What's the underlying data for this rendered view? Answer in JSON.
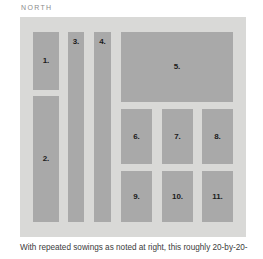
{
  "figure": {
    "orientation_label": "NORTH",
    "caption": "With repeated sowings as noted at right, this roughly 20-by-20-",
    "colors": {
      "page_background": "#ffffff",
      "path_background": "#d9d9d7",
      "bed_fill": "#a9a9a9",
      "label_text": "#1b1b1b",
      "orientation_text": "#8c8c8c",
      "caption_text": "#3b3b3b"
    },
    "beds": [
      {
        "id": "bed-1",
        "label": "1.",
        "shape": "block",
        "x": 13,
        "y": 15,
        "w": 26,
        "h": 58
      },
      {
        "id": "bed-2",
        "label": "2.",
        "shape": "block",
        "x": 13,
        "y": 79,
        "w": 26,
        "h": 126
      },
      {
        "id": "bed-3",
        "label": "3.",
        "shape": "strip",
        "x": 48,
        "y": 15,
        "w": 16,
        "h": 190
      },
      {
        "id": "bed-4",
        "label": "4.",
        "shape": "strip",
        "x": 74,
        "y": 15,
        "w": 17,
        "h": 190
      },
      {
        "id": "bed-5",
        "label": "5.",
        "shape": "block",
        "x": 101,
        "y": 15,
        "w": 112,
        "h": 70
      },
      {
        "id": "bed-6",
        "label": "6.",
        "shape": "block",
        "x": 101,
        "y": 92,
        "w": 31,
        "h": 55
      },
      {
        "id": "bed-7",
        "label": "7.",
        "shape": "block",
        "x": 142,
        "y": 92,
        "w": 31,
        "h": 55
      },
      {
        "id": "bed-8",
        "label": "8.",
        "shape": "block",
        "x": 182,
        "y": 92,
        "w": 31,
        "h": 55
      },
      {
        "id": "bed-9",
        "label": "9.",
        "shape": "block",
        "x": 101,
        "y": 154,
        "w": 31,
        "h": 51
      },
      {
        "id": "bed-10",
        "label": "10.",
        "shape": "block",
        "x": 142,
        "y": 154,
        "w": 31,
        "h": 51
      },
      {
        "id": "bed-11",
        "label": "11.",
        "shape": "block",
        "x": 182,
        "y": 154,
        "w": 31,
        "h": 51
      }
    ]
  }
}
